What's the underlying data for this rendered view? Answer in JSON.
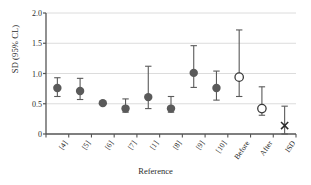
{
  "chart_data": {
    "type": "scatter",
    "title": "",
    "xlabel": "Reference",
    "ylabel": "SD (95% CL)",
    "ylim": [
      0,
      2.0
    ],
    "yticks": [
      "0",
      "0.5",
      "1.0",
      "1.5",
      "2.0"
    ],
    "ytick_values": [
      0,
      0.5,
      1.0,
      1.5,
      2.0
    ],
    "grid": "horizontal",
    "legend": "none",
    "categories": [
      "[4]",
      "[5]",
      "[6]",
      "[7]",
      "[1]",
      "[8]",
      "[9]",
      "[10]",
      "Before",
      "After",
      "ISD"
    ],
    "values": [
      0.76,
      0.71,
      0.51,
      0.42,
      0.61,
      0.42,
      1.01,
      0.76,
      0.94,
      0.42,
      0.14
    ],
    "ci_low": [
      0.62,
      0.57,
      0.51,
      0.36,
      0.42,
      0.36,
      0.77,
      0.56,
      0.62,
      0.31,
      0.0
    ],
    "ci_high": [
      0.93,
      0.92,
      0.51,
      0.58,
      1.12,
      0.62,
      1.46,
      1.04,
      1.72,
      0.78,
      0.46
    ],
    "markers": [
      "filled-circle",
      "filled-circle",
      "filled-circle",
      "filled-circle",
      "filled-circle",
      "filled-circle",
      "filled-circle",
      "filled-circle",
      "open-circle",
      "open-circle",
      "cross"
    ],
    "marker_color": "#5a5a5a",
    "grid_color": "#dcdcdc",
    "axis_color": "#555555"
  }
}
